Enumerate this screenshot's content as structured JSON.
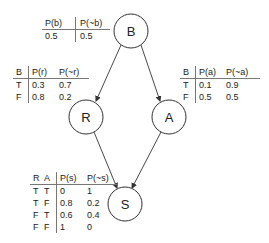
{
  "diagram": {
    "type": "bayesian-network",
    "nodes": [
      {
        "id": "B",
        "label": "B",
        "cx": 131,
        "cy": 31,
        "r": 17
      },
      {
        "id": "R",
        "label": "R",
        "cx": 86,
        "cy": 117,
        "r": 17
      },
      {
        "id": "A",
        "label": "A",
        "cx": 169,
        "cy": 117,
        "r": 17
      },
      {
        "id": "S",
        "label": "S",
        "cx": 125,
        "cy": 204,
        "r": 17
      }
    ],
    "edges": [
      {
        "from": "B",
        "to": "R"
      },
      {
        "from": "B",
        "to": "A"
      },
      {
        "from": "R",
        "to": "S"
      },
      {
        "from": "A",
        "to": "S"
      }
    ]
  },
  "cpt_b": {
    "headers": [
      "P(b)",
      "P(~b)"
    ],
    "rows": [
      [
        "0.5",
        "0.5"
      ]
    ]
  },
  "cpt_r": {
    "headers": [
      "B",
      "P(r)",
      "P(~r)"
    ],
    "rows": [
      [
        "T",
        "0.3",
        "0.7"
      ],
      [
        "F",
        "0.8",
        "0.2"
      ]
    ]
  },
  "cpt_a": {
    "headers": [
      "B",
      "P(a)",
      "P(~a)"
    ],
    "rows": [
      [
        "T",
        "0.1",
        "0.9"
      ],
      [
        "F",
        "0.5",
        "0.5"
      ]
    ]
  },
  "cpt_s": {
    "headers": [
      "R",
      "A",
      "P(s)",
      "P(~s)"
    ],
    "rows": [
      [
        "T",
        "T",
        "0",
        "1"
      ],
      [
        "T",
        "F",
        "0.8",
        "0.2"
      ],
      [
        "F",
        "T",
        "0.6",
        "0.4"
      ],
      [
        "F",
        "F",
        "1",
        "0"
      ]
    ]
  }
}
